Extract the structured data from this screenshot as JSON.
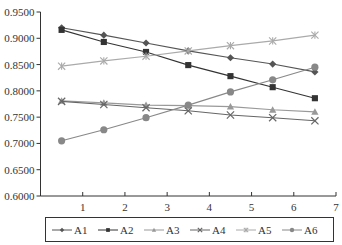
{
  "chart_data": {
    "type": "line",
    "title": "",
    "xlabel": "",
    "ylabel": "",
    "xlim": [
      0,
      7
    ],
    "ylim": [
      0.6,
      0.95
    ],
    "x_ticks": [
      "1",
      "2",
      "3",
      "4",
      "5",
      "6",
      "7"
    ],
    "y_ticks": [
      "0.6000",
      "0.6500",
      "0.7000",
      "0.7500",
      "0.8000",
      "0.8500",
      "0.9000",
      "0.9500"
    ],
    "grid": false,
    "legend_position": "bottom",
    "x": [
      0.5,
      1.5,
      2.5,
      3.5,
      4.5,
      5.5,
      6.5
    ],
    "series": [
      {
        "name": "A1",
        "marker": "diamond",
        "color": "#555555",
        "values": [
          0.92,
          0.906,
          0.891,
          0.876,
          0.863,
          0.851,
          0.836
        ]
      },
      {
        "name": "A2",
        "marker": "square",
        "color": "#333333",
        "values": [
          0.916,
          0.893,
          0.874,
          0.849,
          0.828,
          0.807,
          0.786
        ]
      },
      {
        "name": "A3",
        "marker": "triangle",
        "color": "#999999",
        "values": [
          0.781,
          0.777,
          0.773,
          0.772,
          0.77,
          0.764,
          0.76
        ]
      },
      {
        "name": "A4",
        "marker": "x",
        "color": "#666666",
        "values": [
          0.78,
          0.774,
          0.768,
          0.762,
          0.754,
          0.749,
          0.743
        ]
      },
      {
        "name": "A5",
        "marker": "asterisk",
        "color": "#aaaaaa",
        "values": [
          0.847,
          0.857,
          0.866,
          0.876,
          0.886,
          0.895,
          0.906
        ]
      },
      {
        "name": "A6",
        "marker": "circle",
        "color": "#888888",
        "values": [
          0.705,
          0.726,
          0.749,
          0.773,
          0.798,
          0.821,
          0.845
        ]
      }
    ]
  }
}
